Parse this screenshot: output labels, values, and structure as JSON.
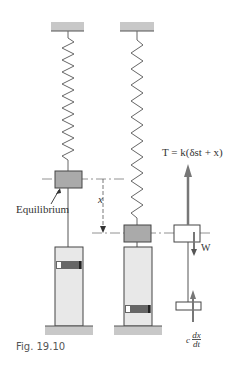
{
  "figure": {
    "caption": "Fig. 19.10",
    "labels": {
      "equilibrium": "Equilibrium",
      "displacement": "x",
      "tension": "T = k(δst + x)",
      "weight": "W",
      "damping_c": "c",
      "damping_num": "dx",
      "damping_den": "dt"
    },
    "colors": {
      "support": "#c8c8c8",
      "block": "#aaaaaa",
      "cylinder": "#e8e8e8",
      "piston": "#666666",
      "line": "#555555"
    }
  }
}
